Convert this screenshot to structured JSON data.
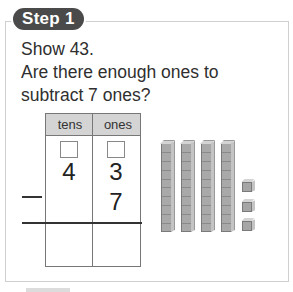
{
  "step": {
    "label": "Step 1"
  },
  "prompt": {
    "line1": "Show 43.",
    "line2": "Are there enough ones to",
    "line3": "subtract 7 ones?"
  },
  "place_value_table": {
    "headers": [
      "tens",
      "ones"
    ],
    "top_number": {
      "tens": "4",
      "ones": "3"
    },
    "subtrahend": {
      "operator": "minus",
      "tens": "",
      "ones": "7"
    },
    "regroup_boxes": [
      "",
      ""
    ],
    "answer": {
      "tens": "",
      "ones": ""
    }
  },
  "base_ten_blocks": {
    "tens_rods": 4,
    "ones_cubes": 3
  }
}
